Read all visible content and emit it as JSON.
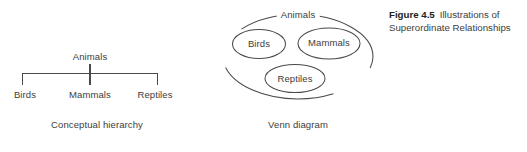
{
  "figure": {
    "caption_number": "Figure 4.5",
    "caption_text": "Illustrations of Superordinate Relationships",
    "stroke_color": "#4a4a4a",
    "text_color": "#3d3d3d",
    "background_color": "#ffffff"
  },
  "tree": {
    "caption": "Conceptual hierarchy",
    "root": "Animals",
    "leaves": [
      {
        "label": "Birds"
      },
      {
        "label": "Mammals"
      },
      {
        "label": "Reptiles"
      }
    ]
  },
  "venn": {
    "caption": "Venn diagram",
    "outer_label": "Animals",
    "inner_sets": [
      {
        "label": "Birds"
      },
      {
        "label": "Mammals"
      },
      {
        "label": "Reptiles"
      }
    ]
  }
}
